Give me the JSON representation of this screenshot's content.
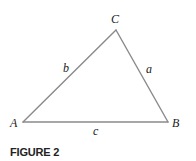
{
  "figure": {
    "caption": "FIGURE 2",
    "line_color": "#8a8a8a",
    "text_color": "#1a1a1a",
    "vertices": {
      "A": "A",
      "B": "B",
      "C": "C"
    },
    "sides": {
      "a": "a",
      "b": "b",
      "c": "c"
    }
  }
}
